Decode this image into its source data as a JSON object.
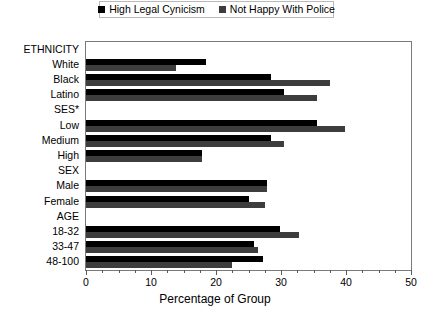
{
  "legend": {
    "position": "top-center",
    "entries": [
      {
        "label": "High Legal Cynicism",
        "color": "#000000",
        "marker": "square-marker"
      },
      {
        "label": "Not Happy With Police",
        "color": "#3d3d3d",
        "marker": "square-marker"
      }
    ]
  },
  "axis": {
    "x_title": "Percentage of Group",
    "x_ticks": [
      "0",
      "10",
      "20",
      "30",
      "40",
      "50"
    ]
  },
  "chart_data": {
    "type": "bar",
    "orientation": "horizontal",
    "title": "",
    "subtitle": "",
    "xlabel": "Percentage of Group",
    "ylabel": "",
    "xlim": [
      0,
      50
    ],
    "xticks": [
      0,
      10,
      20,
      30,
      40,
      50
    ],
    "minor_tick_interval": 2.5,
    "grid": false,
    "legend_position": "top-center",
    "categories": [
      "ETHNICITY",
      "White",
      "Black",
      "Latino",
      "SES*",
      "Low",
      "Medium",
      "High",
      "SEX",
      "Male",
      "Female",
      "AGE",
      "18-32",
      "33-47",
      "48-100"
    ],
    "group_headers": [
      "ETHNICITY",
      "SES*",
      "SEX",
      "AGE"
    ],
    "series": [
      {
        "name": "High Legal Cynicism",
        "color": "#000000",
        "values": [
          null,
          18.5,
          28.5,
          30.5,
          null,
          35.5,
          28.5,
          17.8,
          null,
          27.8,
          25.0,
          null,
          29.8,
          25.8,
          27.2
        ]
      },
      {
        "name": "Not Happy With Police",
        "color": "#3d3d3d",
        "values": [
          null,
          13.8,
          37.5,
          35.5,
          null,
          39.8,
          30.5,
          17.8,
          null,
          27.8,
          27.5,
          null,
          32.8,
          26.5,
          22.5
        ]
      }
    ]
  }
}
